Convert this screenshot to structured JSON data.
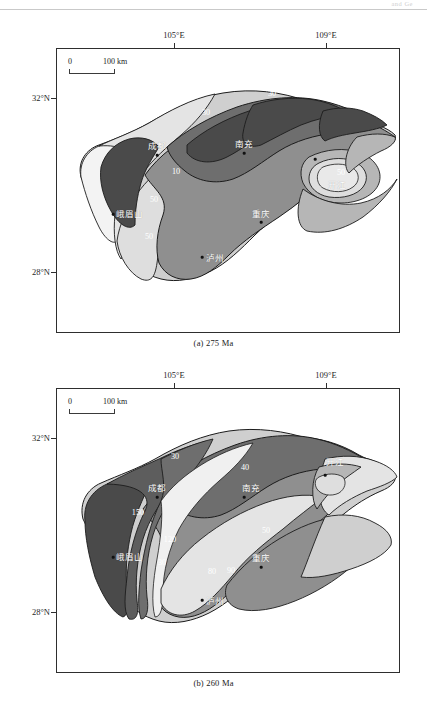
{
  "page": {
    "running_header": "and Ge"
  },
  "panels": [
    {
      "id": "panel-a",
      "caption": "(a) 275 Ma",
      "axes": {
        "lon_ticks": [
          {
            "label": "105°E",
            "x_frac": 0.343
          },
          {
            "label": "109°E",
            "x_frac": 0.785
          }
        ],
        "lat_ticks": [
          {
            "label": "32°N",
            "y_frac": 0.168
          },
          {
            "label": "28°N",
            "y_frac": 0.782
          }
        ]
      },
      "scalebar": {
        "zero": "0",
        "max": "100 km"
      },
      "cities": [
        {
          "name": "成都",
          "x_frac": 0.293,
          "y_frac": 0.348
        },
        {
          "name": "南充",
          "x_frac": 0.546,
          "y_frac": 0.339
        },
        {
          "name": "重庆",
          "x_frac": 0.595,
          "y_frac": 0.58
        },
        {
          "name": "泸州",
          "x_frac": 0.424,
          "y_frac": 0.705
        },
        {
          "name": "峨眉山",
          "x_frac": 0.191,
          "y_frac": 0.57
        },
        {
          "name": "开江",
          "x_frac": 0.778,
          "y_frac": 0.452
        }
      ],
      "contours": [
        {
          "value": "30",
          "x_frac": 0.437,
          "y_frac": 0.221
        },
        {
          "value": "30",
          "x_frac": 0.63,
          "y_frac": 0.153
        },
        {
          "value": "20",
          "x_frac": 0.797,
          "y_frac": 0.155
        },
        {
          "value": "30",
          "x_frac": 0.238,
          "y_frac": 0.252
        },
        {
          "value": "10",
          "x_frac": 0.349,
          "y_frac": 0.428
        },
        {
          "value": "50",
          "x_frac": 0.283,
          "y_frac": 0.527
        },
        {
          "value": "50",
          "x_frac": 0.27,
          "y_frac": 0.655
        },
        {
          "value": "50",
          "x_frac": 0.83,
          "y_frac": 0.43
        }
      ]
    },
    {
      "id": "panel-b",
      "caption": "(b) 260 Ma",
      "axes": {
        "lon_ticks": [
          {
            "label": "105°E",
            "x_frac": 0.343
          },
          {
            "label": "109°E",
            "x_frac": 0.785
          }
        ],
        "lat_ticks": [
          {
            "label": "32°N",
            "y_frac": 0.168
          },
          {
            "label": "28°N",
            "y_frac": 0.782
          }
        ]
      },
      "scalebar": {
        "zero": "0",
        "max": "100 km"
      },
      "cities": [
        {
          "name": "成都",
          "x_frac": 0.293,
          "y_frac": 0.352
        },
        {
          "name": "南充",
          "x_frac": 0.546,
          "y_frac": 0.348
        },
        {
          "name": "重庆",
          "x_frac": 0.595,
          "y_frac": 0.592
        },
        {
          "name": "泸州",
          "x_frac": 0.424,
          "y_frac": 0.712
        },
        {
          "name": "峨眉山",
          "x_frac": 0.191,
          "y_frac": 0.578
        },
        {
          "name": "开江",
          "x_frac": 0.782,
          "y_frac": 0.272
        }
      ],
      "contours": [
        {
          "value": "30",
          "x_frac": 0.344,
          "y_frac": 0.236
        },
        {
          "value": "40",
          "x_frac": 0.551,
          "y_frac": 0.276
        },
        {
          "value": "50",
          "x_frac": 0.61,
          "y_frac": 0.496
        },
        {
          "value": "150",
          "x_frac": 0.236,
          "y_frac": 0.434
        },
        {
          "value": "120",
          "x_frac": 0.33,
          "y_frac": 0.53
        },
        {
          "value": "30",
          "x_frac": 0.308,
          "y_frac": 0.61
        },
        {
          "value": "80",
          "x_frac": 0.452,
          "y_frac": 0.642
        },
        {
          "value": "90",
          "x_frac": 0.508,
          "y_frac": 0.638
        }
      ]
    }
  ],
  "colors": {
    "frame": "#2e2e2e",
    "shade_darkest": "#4a4a4a",
    "shade_dark": "#6e6e6e",
    "shade_mid": "#8f8f8f",
    "shade_light": "#b6b6b6",
    "shade_lighter": "#cfcfcf",
    "shade_lightest": "#e4e4e4",
    "shade_white": "#f3f3f3",
    "outline": "#1c1c1c",
    "label_white": "#ffffff"
  }
}
